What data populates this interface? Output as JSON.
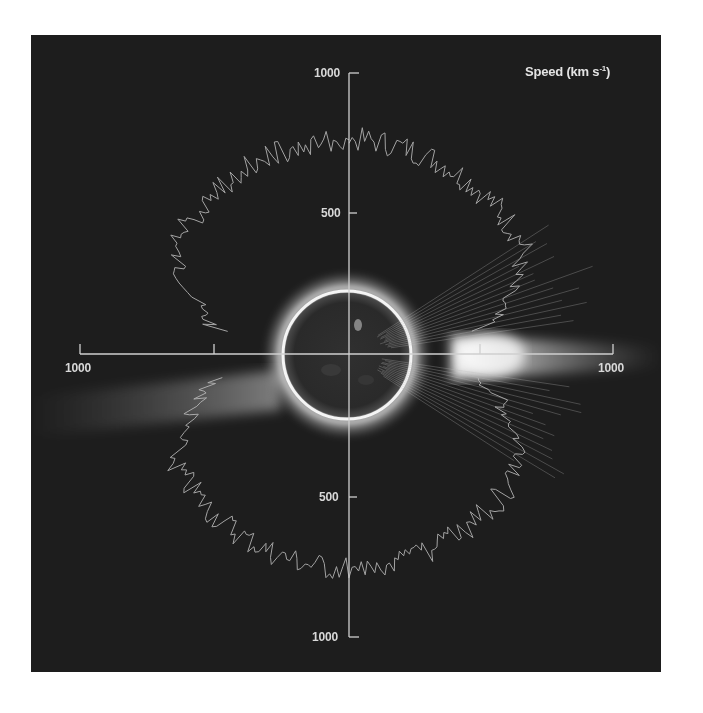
{
  "chart_data": {
    "type": "scatter",
    "subtype": "polar speed plot overlaid on solar coronal image",
    "title": "Speed (km s-1)",
    "title_display": {
      "main": "Speed (km s",
      "superscript": "-1",
      "close": ")"
    },
    "units": "km s-1",
    "axes": {
      "vertical": {
        "ticks": [
          {
            "position": "top",
            "value": 1000,
            "label": "1000"
          },
          {
            "position": "top",
            "value": 500,
            "label": "500"
          },
          {
            "position": "bottom",
            "value": 500,
            "label": "500"
          },
          {
            "position": "bottom",
            "value": 1000,
            "label": "1000"
          }
        ],
        "range": [
          -1000,
          1000
        ]
      },
      "horizontal": {
        "ticks": [
          {
            "position": "left",
            "value": 1000,
            "label": "1000"
          },
          {
            "position": "left",
            "value": 500,
            "label": ""
          },
          {
            "position": "right",
            "value": 500,
            "label": ""
          },
          {
            "position": "right",
            "value": 1000,
            "label": "1000"
          }
        ],
        "range": [
          -1000,
          1000
        ]
      }
    },
    "grid": false,
    "legend": "none",
    "series": [
      {
        "name": "solar wind speed trace (polar plot)",
        "description": "Speed vs heliographic latitude, plotted radially from the Sun's center; fast wind ~750-800 km/s at high latitudes, slower ~300-450 km/s near the equator",
        "quadrants": [
          {
            "quadrant": "upper-left",
            "latitude_range_deg": [
              90,
              10
            ],
            "approx_speed_kms": [
              760,
              350
            ]
          },
          {
            "quadrant": "upper-right",
            "latitude_range_deg": [
              90,
              10
            ],
            "approx_speed_kms": [
              760,
              400
            ]
          },
          {
            "quadrant": "lower-left",
            "latitude_range_deg": [
              -10,
              -90
            ],
            "approx_speed_kms": [
              400,
              760
            ]
          },
          {
            "quadrant": "lower-right",
            "latitude_range_deg": [
              -10,
              -90
            ],
            "approx_speed_kms": [
              420,
              760
            ]
          }
        ]
      }
    ],
    "image_features": {
      "central_body": "solar disk (dark EUV image) with bright limb corona",
      "streamers": [
        "bright equatorial streamer to the east (right)",
        "diffuse streamer to the west (left, slightly below equator)"
      ]
    }
  },
  "labels": {
    "title": "Speed (km s-1)",
    "v_top_1000": "1000",
    "v_top_500": "500",
    "v_bottom_500": "500",
    "v_bottom_1000": "1000",
    "h_left_1000": "1000",
    "h_right_1000": "1000"
  },
  "colors": {
    "panel_background": "#1d1d1d",
    "axis": "#cfcfcf",
    "trace": "#bdbdbd",
    "corona": "#ffffff",
    "disk": "#2a2a2a"
  }
}
